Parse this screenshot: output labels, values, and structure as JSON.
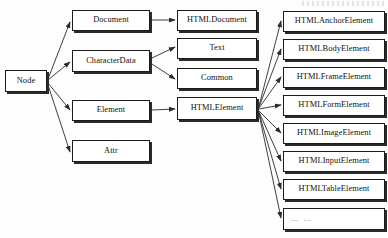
{
  "diagram": {
    "type": "class-hierarchy",
    "width": 388,
    "height": 238,
    "colors": {
      "box_fill": "#ffffff",
      "box_border": "#1b1b1b",
      "box_shadow": "#2a2a2a",
      "edge": "#2b2b2b",
      "text": "#111111",
      "background": "#fdfdfd"
    }
  },
  "nodes": {
    "root": {
      "id": "node",
      "label": "Node",
      "x": 5,
      "y": 70,
      "w": 42,
      "h": 22
    },
    "level2": [
      {
        "id": "document",
        "label": "Document",
        "x": 72,
        "y": 10,
        "w": 78,
        "h": 21
      },
      {
        "id": "characterdata",
        "label": "CharacterData",
        "x": 72,
        "y": 50,
        "w": 78,
        "h": 22
      },
      {
        "id": "element",
        "label": "Element",
        "x": 72,
        "y": 100,
        "w": 78,
        "h": 21
      },
      {
        "id": "attr",
        "label": "Attr",
        "x": 72,
        "y": 140,
        "w": 78,
        "h": 22
      }
    ],
    "level3": [
      {
        "id": "htmldocument",
        "label": "HTMLDocument",
        "x": 177,
        "y": 10,
        "w": 80,
        "h": 21
      },
      {
        "id": "text",
        "label": "Text",
        "x": 177,
        "y": 38,
        "w": 80,
        "h": 21
      },
      {
        "id": "common",
        "label": "Common",
        "x": 177,
        "y": 68,
        "w": 80,
        "h": 21
      },
      {
        "id": "htmlelement",
        "label": "HTMLElement",
        "x": 177,
        "y": 97,
        "w": 80,
        "h": 23
      }
    ],
    "level4": [
      {
        "id": "htmlanchorelement",
        "label": "HTMLAnchorElement",
        "x": 283,
        "y": 11,
        "w": 102,
        "h": 21,
        "dots": false
      },
      {
        "id": "htmlbodyelement",
        "label": "HTMLBodyElement",
        "x": 283,
        "y": 39,
        "w": 102,
        "h": 21,
        "dots": false
      },
      {
        "id": "htmlframeelement",
        "label": "HTMLFrameElement",
        "x": 283,
        "y": 67,
        "w": 102,
        "h": 21,
        "dots": false
      },
      {
        "id": "htmlformelement",
        "label": "HTMLFormElement",
        "x": 283,
        "y": 95,
        "w": 102,
        "h": 21,
        "dots": false
      },
      {
        "id": "htmlimageelement",
        "label": "HTMLImageElement",
        "x": 283,
        "y": 123,
        "w": 102,
        "h": 21,
        "dots": false
      },
      {
        "id": "htmlinputelement",
        "label": "HTMLInputElement",
        "x": 283,
        "y": 151,
        "w": 102,
        "h": 21,
        "dots": false
      },
      {
        "id": "htmltableelement",
        "label": "HTMLTableElement",
        "x": 283,
        "y": 179,
        "w": 102,
        "h": 21,
        "dots": false
      },
      {
        "id": "ellipsis",
        "label": "… …",
        "x": 283,
        "y": 208,
        "w": 102,
        "h": 22,
        "dots": true
      }
    ]
  },
  "edges": [
    {
      "from": "node",
      "to": "document",
      "x1": 48,
      "y1": 79,
      "x2": 70,
      "y2": 22
    },
    {
      "from": "node",
      "to": "characterdata",
      "x1": 48,
      "y1": 80,
      "x2": 70,
      "y2": 62
    },
    {
      "from": "node",
      "to": "element",
      "x1": 48,
      "y1": 83,
      "x2": 70,
      "y2": 110
    },
    {
      "from": "node",
      "to": "attr",
      "x1": 48,
      "y1": 85,
      "x2": 70,
      "y2": 152
    },
    {
      "from": "document",
      "to": "htmldocument",
      "x1": 152,
      "y1": 20,
      "x2": 175,
      "y2": 20
    },
    {
      "from": "characterdata",
      "to": "text",
      "x1": 152,
      "y1": 58,
      "x2": 175,
      "y2": 47
    },
    {
      "from": "characterdata",
      "to": "common",
      "x1": 152,
      "y1": 64,
      "x2": 175,
      "y2": 79
    },
    {
      "from": "element",
      "to": "htmlelement",
      "x1": 152,
      "y1": 110,
      "x2": 175,
      "y2": 109
    },
    {
      "from": "htmlelement",
      "to": "htmlanchorelement",
      "x1": 259,
      "y1": 106,
      "x2": 281,
      "y2": 21
    },
    {
      "from": "htmlelement",
      "to": "htmlbodyelement",
      "x1": 259,
      "y1": 107,
      "x2": 281,
      "y2": 49
    },
    {
      "from": "htmlelement",
      "to": "htmlframeelement",
      "x1": 259,
      "y1": 108,
      "x2": 281,
      "y2": 77
    },
    {
      "from": "htmlelement",
      "to": "htmlformelement",
      "x1": 259,
      "y1": 109,
      "x2": 281,
      "y2": 105
    },
    {
      "from": "htmlelement",
      "to": "htmlimageelement",
      "x1": 259,
      "y1": 111,
      "x2": 281,
      "y2": 133
    },
    {
      "from": "htmlelement",
      "to": "htmlinputelement",
      "x1": 259,
      "y1": 112,
      "x2": 281,
      "y2": 161
    },
    {
      "from": "htmlelement",
      "to": "htmltableelement",
      "x1": 259,
      "y1": 113,
      "x2": 281,
      "y2": 189
    },
    {
      "from": "htmlelement",
      "to": "ellipsis",
      "x1": 259,
      "y1": 114,
      "x2": 281,
      "y2": 218
    }
  ]
}
